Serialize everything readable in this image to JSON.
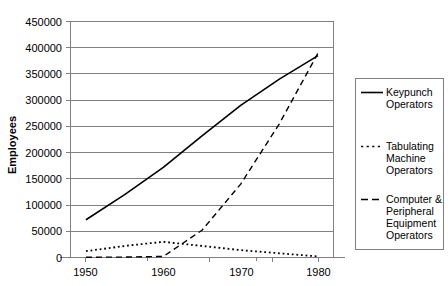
{
  "chart_data": {
    "type": "line",
    "title": "",
    "xlabel": "",
    "ylabel": "Employees",
    "xlim": [
      1948,
      1982
    ],
    "ylim": [
      0,
      450000
    ],
    "grid": true,
    "legend_position": "right",
    "y_ticks": [
      "0",
      "50000",
      "100000",
      "150000",
      "200000",
      "250000",
      "300000",
      "350000",
      "400000",
      "450000"
    ],
    "y_tick_values": [
      0,
      50000,
      100000,
      150000,
      200000,
      250000,
      300000,
      350000,
      400000,
      450000
    ],
    "x_ticks": [
      "1950",
      "1960",
      "1970",
      "1980"
    ],
    "x_tick_values": [
      1950,
      1960,
      1970,
      1980
    ],
    "x_minor_tick_values": [
      1955,
      1965,
      1975
    ],
    "series": [
      {
        "name": "Keypunch Operators",
        "style": "solid",
        "color": "#000000",
        "x": [
          1950,
          1955,
          1960,
          1965,
          1970,
          1975,
          1980
        ],
        "values": [
          72000,
          120000,
          172000,
          232000,
          290000,
          340000,
          385000
        ]
      },
      {
        "name": "Tabulating Machine Operators",
        "style": "dotted",
        "color": "#000000",
        "x": [
          1950,
          1955,
          1960,
          1965,
          1970,
          1975,
          1980
        ],
        "values": [
          12000,
          22000,
          30000,
          22000,
          14000,
          8000,
          2000
        ]
      },
      {
        "name": "Computer & Peripheral Equipment Operators",
        "style": "dashed",
        "color": "#000000",
        "x": [
          1950,
          1955,
          1960,
          1965,
          1970,
          1975,
          1980
        ],
        "values": [
          500,
          800,
          2000,
          52000,
          140000,
          255000,
          390000
        ]
      }
    ]
  },
  "legend": {
    "entries": [
      {
        "label_line1": "Keypunch",
        "label_line2": "Operators",
        "label_line3": "",
        "label_line4": "",
        "style": "solid"
      },
      {
        "label_line1": "Tabulating",
        "label_line2": "Machine",
        "label_line3": "Operators",
        "label_line4": "",
        "style": "dotted"
      },
      {
        "label_line1": "Computer &",
        "label_line2": "Peripheral",
        "label_line3": "Equipment",
        "label_line4": "Operators",
        "style": "dashed"
      }
    ]
  },
  "colors": {
    "grid": "#808080",
    "frame": "#808080",
    "series": "#000000",
    "background": "#ffffff"
  }
}
